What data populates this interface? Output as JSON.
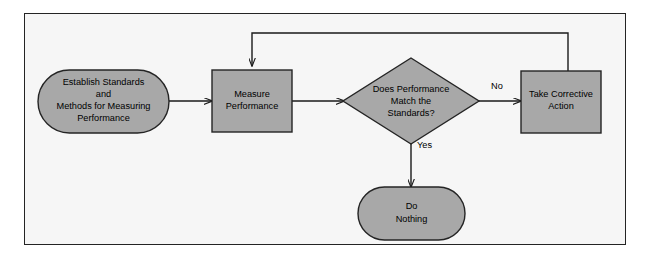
{
  "diagram": {
    "frame": {
      "background_color": "#f6f6f6",
      "border_color": "#242424"
    },
    "style": {
      "node_fill": "#a8a8a8",
      "node_stroke": "#242424",
      "edge_color": "#1a1a1a",
      "text_color": "#000000"
    },
    "nodes": [
      {
        "id": "establish-standards",
        "shape": "stadium",
        "lines": [
          "Establish Standards",
          "and",
          "Methods for Measuring",
          "Performance"
        ]
      },
      {
        "id": "measure-performance",
        "shape": "rectangle",
        "lines": [
          "Measure",
          "Performance"
        ]
      },
      {
        "id": "does-performance-match",
        "shape": "diamond",
        "lines": [
          "Does Performance",
          "Match the",
          "Standards?"
        ]
      },
      {
        "id": "take-corrective-action",
        "shape": "rectangle",
        "lines": [
          "Take Corrective",
          "Action"
        ]
      },
      {
        "id": "do-nothing",
        "shape": "stadium",
        "lines": [
          "Do",
          "Nothing"
        ]
      }
    ],
    "edges": [
      {
        "id": "standards-to-measure",
        "from": "establish-standards",
        "to": "measure-performance",
        "label": ""
      },
      {
        "id": "measure-to-decision",
        "from": "measure-performance",
        "to": "does-performance-match",
        "label": ""
      },
      {
        "id": "decision-to-corrective",
        "from": "does-performance-match",
        "to": "take-corrective-action",
        "label": "No"
      },
      {
        "id": "decision-to-donothing",
        "from": "does-performance-match",
        "to": "do-nothing",
        "label": "Yes"
      },
      {
        "id": "corrective-feedback-loop",
        "from": "take-corrective-action",
        "to": "measure-performance",
        "label": ""
      }
    ]
  }
}
